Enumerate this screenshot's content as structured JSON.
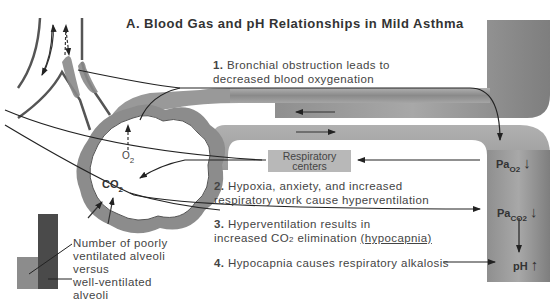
{
  "title": "A. Blood Gas and pH Relationships in Mild Asthma",
  "steps": [
    {
      "num": "1.",
      "line1": "Bronchial obstruction leads to",
      "line2": "decreased blood oxygenation"
    },
    {
      "num": "2.",
      "line1": "Hypoxia, anxiety, and increased",
      "line2": "respiratory work cause hyperventilation"
    },
    {
      "num": "3.",
      "line1": "Hyperventilation results in",
      "line2_pre": "increased CO",
      "line2_sub": "2",
      "line2_mid": " elimination ",
      "line2_u": "(hypocapnia)"
    },
    {
      "num": "4.",
      "line1": "Hypocapnia causes respiratory alkalosis"
    }
  ],
  "respiratory_centers": {
    "line1": "Respiratory",
    "line2": "centers"
  },
  "labels": {
    "o2": {
      "main": "O",
      "sub": "2"
    },
    "co2": {
      "main": "CO",
      "sub": "2"
    },
    "pao2": {
      "main": "Pa",
      "sub": "O2",
      "arrow": "↓"
    },
    "paco2": {
      "main": "Pa",
      "sub": "CO2",
      "arrow": "↓"
    },
    "ph": {
      "main": "pH",
      "arrow": "↑"
    }
  },
  "legend": {
    "line1": "Number of poorly",
    "line2": "ventilated alveoli",
    "line3": "versus",
    "line4": "well-ventilated",
    "line5": "alveoli"
  },
  "colors": {
    "vessel": "#8a8a8a",
    "box": "#b8b8b8",
    "legend_light": "#8c8c8c",
    "legend_dark": "#4a4a4a",
    "line": "#222222"
  }
}
